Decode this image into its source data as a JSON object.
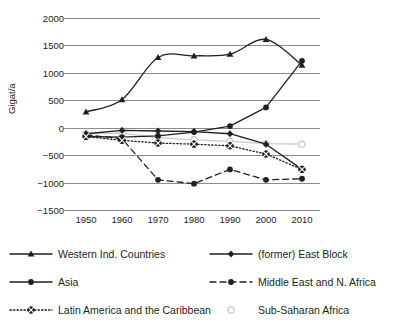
{
  "top_caption": "",
  "axes": {
    "ylabel": "Gigat/a",
    "yticks": [
      "2000",
      "1500",
      "1000",
      "500",
      "0",
      "-500",
      "-1000",
      "-1500"
    ],
    "xticks": [
      "1950",
      "1960",
      "1970",
      "1980",
      "1990",
      "2000",
      "2010"
    ]
  },
  "chart_data": {
    "type": "line",
    "title": "",
    "xlabel": "",
    "ylabel": "Gigat/a",
    "x": [
      1950,
      1960,
      1970,
      1980,
      1990,
      2000,
      2010
    ],
    "xlim": [
      1945,
      2015
    ],
    "ylim": [
      -1500,
      2000
    ],
    "ytick_step": 500,
    "grid": "horizontal",
    "legend_position": "below",
    "series": [
      {
        "name": "Western Ind. Countries",
        "marker": "triangle",
        "line": "solid",
        "color": "#231f20",
        "values": [
          290,
          510,
          1280,
          1310,
          1340,
          1610,
          1140
        ]
      },
      {
        "name": "(former) East Block",
        "marker": "diamond",
        "line": "solid",
        "color": "#231f20",
        "values": [
          -110,
          -50,
          -60,
          -70,
          -110,
          -300,
          -760
        ]
      },
      {
        "name": "Asia",
        "marker": "circle-filled",
        "line": "solid",
        "color": "#231f20",
        "values": [
          -160,
          -170,
          -150,
          -80,
          30,
          370,
          1220
        ]
      },
      {
        "name": "Middle East and N. Africa",
        "marker": "circle-filled",
        "line": "dashed",
        "color": "#231f20",
        "values": [
          -130,
          -200,
          -950,
          -1020,
          -760,
          -950,
          -930
        ]
      },
      {
        "name": "Latin America and the Caribbean",
        "marker": "circle-cross",
        "line": "dotted",
        "color": "#231f20",
        "values": [
          -160,
          -230,
          -280,
          -300,
          -330,
          -480,
          -760
        ]
      },
      {
        "name": "Sub-Saharan Africa",
        "marker": "circle-open",
        "line": "solid",
        "color": "#c9c9c9",
        "values": [
          -110,
          -100,
          -180,
          -220,
          -250,
          -290,
          -300
        ]
      }
    ]
  },
  "legend": [
    {
      "label": "Western Ind. Countries"
    },
    {
      "label": "(former) East Block"
    },
    {
      "label": "Asia"
    },
    {
      "label": "Middle East and N. Africa"
    },
    {
      "label": "Latin America and the Caribbean"
    },
    {
      "label": "Sub-Saharan Africa"
    }
  ]
}
